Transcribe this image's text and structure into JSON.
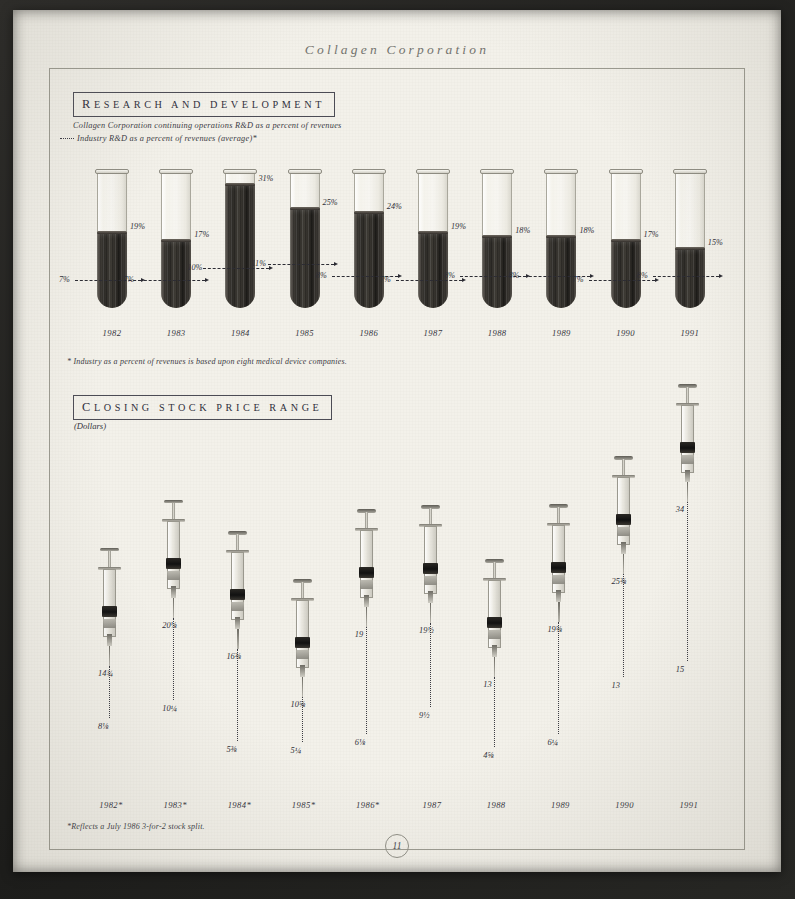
{
  "page": {
    "running_head": "Collagen Corporation",
    "folio": "11",
    "paper_color": "#f3f1ea",
    "ink_color": "#2f2f38"
  },
  "rd_section": {
    "heading_first": "R",
    "heading_rest": "ESEARCH AND DEVELOPMENT",
    "legend_solid": "Collagen Corporation continuing operations R&D as a percent of revenues",
    "legend_dashed": "Industry R&D as a percent of revenues (average)*",
    "footnote": "* Industry as a percent of revenues is based upon eight medical device companies."
  },
  "stock_section": {
    "heading_first": "C",
    "heading_rest": "LOSING STOCK PRICE RANGE",
    "unit": "(Dollars)",
    "footnote": "*Reflects a July 1986 3-for-2 stock split."
  },
  "chart_data": [
    {
      "type": "bar",
      "title": "Research and Development",
      "subtitle": "R&D as a percent of revenues",
      "xlabel": "",
      "ylabel": "Percent of revenues",
      "ylim": [
        0,
        30
      ],
      "grid": false,
      "legend_position": "top-left",
      "glyph": "test-tube",
      "categories": [
        "1982",
        "1983",
        "1984",
        "1985",
        "1986",
        "1987",
        "1988",
        "1989",
        "1990",
        "1991"
      ],
      "series": [
        {
          "name": "Collagen Corporation continuing operations R&D as a percent of revenues",
          "style": "filled-tube",
          "values": [
            19,
            17,
            31,
            25,
            24,
            19,
            18,
            18,
            17,
            15
          ],
          "labels": [
            "19%",
            "17%",
            "31%",
            "25%",
            "24%",
            "19%",
            "18%",
            "18%",
            "17%",
            "15%"
          ]
        },
        {
          "name": "Industry R&D as a percent of revenues (average)*",
          "style": "dashed-marker",
          "values": [
            7,
            7,
            10,
            11,
            8,
            7,
            8,
            8,
            7,
            8
          ],
          "labels": [
            "7%",
            "7%",
            "10%",
            "11%",
            "8%",
            "7%",
            "8%",
            "8%",
            "7%",
            "8%"
          ]
        }
      ]
    },
    {
      "type": "range",
      "title": "Closing Stock Price Range",
      "subtitle": "(Dollars)",
      "xlabel": "",
      "ylabel": "Dollars",
      "ylim": [
        0,
        36
      ],
      "grid": false,
      "glyph": "syringe",
      "categories": [
        "1982*",
        "1983*",
        "1984*",
        "1985*",
        "1986*",
        "1987",
        "1988",
        "1989",
        "1990",
        "1991"
      ],
      "series": [
        {
          "name": "High",
          "values": [
            14.375,
            20.125,
            16.375,
            10.625,
            19.0,
            19.5,
            13.0,
            19.625,
            25.375,
            34.0
          ],
          "labels": [
            "14¾",
            "20⅛",
            "16⅜",
            "10⅝",
            "19",
            "19½",
            "13",
            "19⅝",
            "25⅜",
            "34"
          ]
        },
        {
          "name": "Low",
          "values": [
            8.125,
            10.25,
            5.375,
            5.25,
            6.25,
            9.5,
            4.625,
            6.25,
            13.0,
            15.0
          ],
          "labels": [
            "8⅛",
            "10¼",
            "5⅜",
            "5¼",
            "6⅛",
            "9½",
            "4⅝",
            "6¼",
            "13",
            "15"
          ]
        }
      ]
    }
  ]
}
